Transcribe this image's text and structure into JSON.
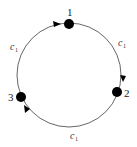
{
  "diagram": {
    "type": "cycle-graph",
    "colors": {
      "edge": "#555555",
      "node": "#000000",
      "text": "#1a1a1a"
    },
    "nodes": [
      {
        "id": "1",
        "label": "1"
      },
      {
        "id": "2",
        "label": "2"
      },
      {
        "id": "3",
        "label": "3"
      }
    ],
    "edges": [
      {
        "from": "3",
        "to": "1",
        "label": "c",
        "subscript": "1"
      },
      {
        "from": "1",
        "to": "2",
        "label": "c",
        "subscript": "1"
      },
      {
        "from": "2",
        "to": "3",
        "label": "c",
        "subscript": "1"
      }
    ]
  }
}
